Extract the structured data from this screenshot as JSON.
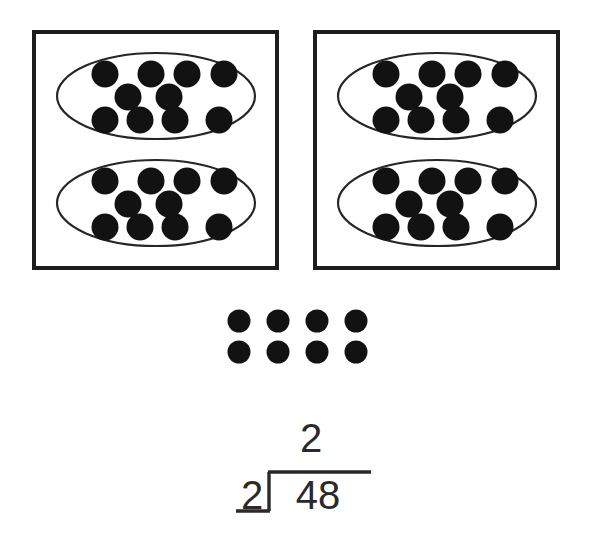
{
  "scene": {
    "title": "Division model: 48 divided by 2",
    "background_color": "#ffffff",
    "counter_color": "#121212",
    "outline_color": "#1d1d1d",
    "ellipse_color": "#262626"
  },
  "boxes": [
    {
      "name": "left-box",
      "x": 34,
      "y": 32,
      "width": 243,
      "height": 236,
      "groups": [
        {
          "name": "left-box-group-top",
          "cx": 156,
          "cy": 96,
          "rx": 99,
          "ry": 43,
          "counter_count": 10,
          "counter_radius": 13.5,
          "rows": [
            {
              "cy": 74,
              "cxs": [
                105,
                151,
                187,
                224
              ]
            },
            {
              "cy": 97,
              "cxs": [
                128,
                169
              ]
            },
            {
              "cy": 120,
              "cxs": [
                105,
                140,
                175,
                219
              ]
            }
          ]
        },
        {
          "name": "left-box-group-bottom",
          "cx": 156,
          "cy": 203,
          "rx": 99,
          "ry": 43,
          "counter_count": 10,
          "counter_radius": 13.5,
          "rows": [
            {
              "cy": 181,
              "cxs": [
                105,
                151,
                187,
                224
              ]
            },
            {
              "cy": 204,
              "cxs": [
                128,
                169
              ]
            },
            {
              "cy": 227,
              "cxs": [
                105,
                140,
                175,
                219
              ]
            }
          ]
        }
      ]
    },
    {
      "name": "right-box",
      "x": 315,
      "y": 32,
      "width": 243,
      "height": 236,
      "groups": [
        {
          "name": "right-box-group-top",
          "cx": 437,
          "cy": 96,
          "rx": 99,
          "ry": 43,
          "counter_count": 10,
          "counter_radius": 13.5,
          "rows": [
            {
              "cy": 74,
              "cxs": [
                386,
                432,
                468,
                505
              ]
            },
            {
              "cy": 97,
              "cxs": [
                409,
                450
              ]
            },
            {
              "cy": 120,
              "cxs": [
                386,
                421,
                456,
                500
              ]
            }
          ]
        },
        {
          "name": "right-box-group-bottom",
          "cx": 437,
          "cy": 203,
          "rx": 99,
          "ry": 43,
          "counter_count": 10,
          "counter_radius": 13.5,
          "rows": [
            {
              "cy": 181,
              "cxs": [
                386,
                432,
                468,
                505
              ]
            },
            {
              "cy": 204,
              "cxs": [
                409,
                450
              ]
            },
            {
              "cy": 227,
              "cxs": [
                386,
                421,
                456,
                500
              ]
            }
          ]
        }
      ]
    }
  ],
  "loose_counters": {
    "name": "loose-counter-grid",
    "count": 8,
    "columns": 4,
    "rows": 2,
    "counter_radius": 11.5,
    "cxs": [
      239,
      278,
      317,
      356
    ],
    "cys": [
      321,
      352
    ]
  },
  "division": {
    "name": "long-division-problem",
    "quotient": "2",
    "divisor": "2",
    "dividend": "48",
    "quotient_x": 311,
    "quotient_y": 452,
    "divisor_x": 252,
    "divisor_y": 509,
    "dividend_x": 318,
    "dividend_y": 509,
    "vinculum": {
      "x1": 268,
      "y1": 472,
      "x2": 371,
      "y2": 472
    },
    "bracket_stem": {
      "x1": 269,
      "y1": 472,
      "x2": 269,
      "y2": 511
    },
    "divisor_underline": {
      "x1": 236,
      "y1": 511,
      "x2": 270,
      "y2": 511
    }
  },
  "chart_data": {
    "type": "table",
    "totals": {
      "boxes": 2,
      "groups_per_box": 2,
      "counters_per_group": 10,
      "counters_in_boxes": 40,
      "loose_counters": 8,
      "total_counters": 48
    },
    "equation": {
      "dividend": 48,
      "divisor": 2,
      "quotient_shown": 2
    }
  }
}
